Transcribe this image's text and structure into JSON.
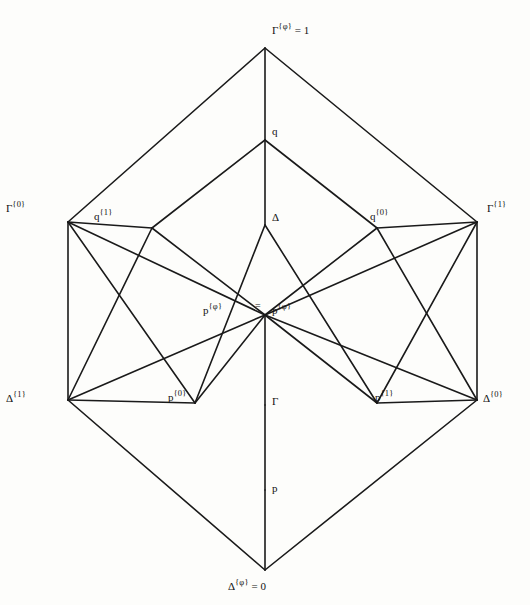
{
  "figure": {
    "type": "lattice-hasse-diagram",
    "background": "#fdfdfb",
    "line_color": "#1a1a1a",
    "width": 530,
    "height": 605
  },
  "nodes": {
    "top": {
      "id": "gamma-phi-top",
      "base": "Γ",
      "sup": "{φ}",
      "eq": "= 1",
      "x": 265,
      "y": 48,
      "label_x": 272,
      "label_y": 22,
      "anchor": "center"
    },
    "bottom": {
      "id": "delta-phi-bottom",
      "base": "Δ",
      "sup": "{φ}",
      "eq": "= 0",
      "x": 265,
      "y": 570,
      "label_x": 228,
      "label_y": 578,
      "anchor": "left"
    },
    "q_top": {
      "id": "q-upper",
      "base": "q",
      "sup": "",
      "eq": "",
      "x": 265,
      "y": 140,
      "label_x": 272,
      "label_y": 126,
      "anchor": "left"
    },
    "delta_mid": {
      "id": "delta-mid",
      "base": "Δ",
      "sup": "",
      "eq": "",
      "x": 265,
      "y": 225,
      "label_x": 272,
      "label_y": 212,
      "anchor": "left"
    },
    "gamma_mid": {
      "id": "gamma-mid",
      "base": "Γ",
      "sup": "",
      "eq": "",
      "x": 265,
      "y": 405,
      "label_x": 272,
      "label_y": 396,
      "anchor": "left"
    },
    "p_bot": {
      "id": "p-lower",
      "base": "p",
      "sup": "",
      "eq": "",
      "x": 265,
      "y": 490,
      "label_x": 272,
      "label_y": 483,
      "anchor": "left"
    },
    "gamma_0": {
      "id": "gamma-0",
      "base": "Γ",
      "sup": "{0}",
      "eq": "",
      "x": 68,
      "y": 222,
      "label_x": 6,
      "label_y": 200,
      "anchor": "left"
    },
    "gamma_1": {
      "id": "gamma-1",
      "base": "Γ",
      "sup": "{1}",
      "eq": "",
      "x": 477,
      "y": 222,
      "label_x": 487,
      "label_y": 200,
      "anchor": "left"
    },
    "delta_1": {
      "id": "delta-1",
      "base": "Δ",
      "sup": "{1}",
      "eq": "",
      "x": 68,
      "y": 400,
      "label_x": 6,
      "label_y": 390,
      "anchor": "left"
    },
    "delta_0": {
      "id": "delta-0",
      "base": "Δ",
      "sup": "{0}",
      "eq": "",
      "x": 477,
      "y": 400,
      "label_x": 483,
      "label_y": 390,
      "anchor": "left"
    },
    "q_1": {
      "id": "q-1",
      "base": "q",
      "sup": "{1}",
      "eq": "",
      "x": 152,
      "y": 228,
      "label_x": 94,
      "label_y": 208,
      "anchor": "left"
    },
    "q_0": {
      "id": "q-0",
      "base": "q",
      "sup": "{0}",
      "eq": "",
      "x": 377,
      "y": 228,
      "label_x": 370,
      "label_y": 208,
      "anchor": "left"
    },
    "p_0": {
      "id": "p-0",
      "base": "p",
      "sup": "{0}",
      "eq": "",
      "x": 195,
      "y": 403,
      "label_x": 168,
      "label_y": 389,
      "anchor": "left"
    },
    "p_1": {
      "id": "p-1",
      "base": "p",
      "sup": "{1}",
      "eq": "",
      "x": 377,
      "y": 403,
      "label_x": 375,
      "label_y": 389,
      "anchor": "left"
    },
    "center": {
      "id": "center-meet",
      "base": "",
      "sup": "",
      "eq": "",
      "x": 265,
      "y": 315,
      "label_x": 0,
      "label_y": 0,
      "anchor": "left"
    }
  },
  "center_labels": {
    "left": {
      "base": "p",
      "sup": "{φ}",
      "x": 203,
      "y": 302
    },
    "right": {
      "base": "p",
      "sup": "{φ}",
      "x": 272,
      "y": 302
    },
    "equals": {
      "text": "=",
      "x": 255,
      "y": 300
    }
  },
  "edges": [
    {
      "from": "top",
      "to": "gamma_0"
    },
    {
      "from": "top",
      "to": "gamma_1"
    },
    {
      "from": "top",
      "to": "q_top"
    },
    {
      "from": "gamma_0",
      "to": "delta_1"
    },
    {
      "from": "gamma_1",
      "to": "delta_0"
    },
    {
      "from": "delta_1",
      "to": "bottom"
    },
    {
      "from": "delta_0",
      "to": "bottom"
    },
    {
      "from": "p_bot",
      "to": "bottom"
    },
    {
      "from": "q_top",
      "to": "q_1"
    },
    {
      "from": "q_top",
      "to": "q_0"
    },
    {
      "from": "q_top",
      "to": "delta_mid"
    },
    {
      "from": "q_1",
      "to": "gamma_0"
    },
    {
      "from": "q_0",
      "to": "gamma_1"
    },
    {
      "from": "q_1",
      "to": "center"
    },
    {
      "from": "q_0",
      "to": "center"
    },
    {
      "from": "delta_mid",
      "to": "p_0"
    },
    {
      "from": "delta_mid",
      "to": "p_1"
    },
    {
      "from": "p_0",
      "to": "delta_1"
    },
    {
      "from": "p_1",
      "to": "delta_0"
    },
    {
      "from": "p_0",
      "to": "center"
    },
    {
      "from": "p_1",
      "to": "center"
    },
    {
      "from": "center",
      "to": "gamma_mid"
    },
    {
      "from": "gamma_mid",
      "to": "p_bot"
    },
    {
      "from": "gamma_0",
      "to": "p_0"
    },
    {
      "from": "gamma_0",
      "to": "center"
    },
    {
      "from": "gamma_1",
      "to": "p_1"
    },
    {
      "from": "gamma_1",
      "to": "center"
    },
    {
      "from": "delta_1",
      "to": "q_1"
    },
    {
      "from": "delta_1",
      "to": "center"
    },
    {
      "from": "delta_0",
      "to": "q_0"
    },
    {
      "from": "delta_0",
      "to": "center"
    }
  ]
}
